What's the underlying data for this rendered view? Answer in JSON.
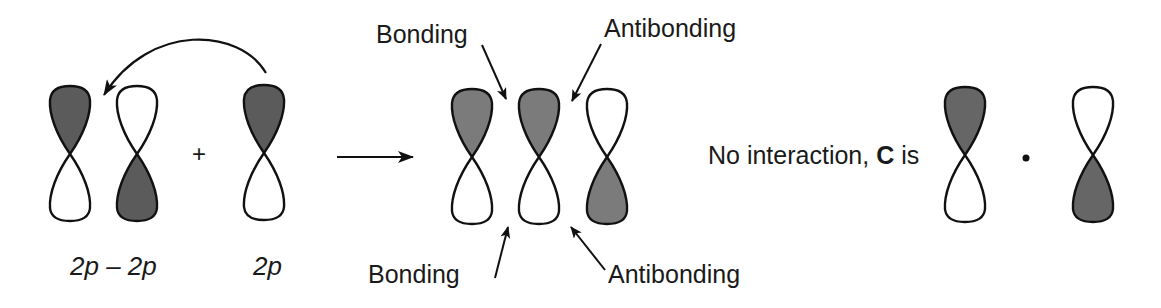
{
  "figure": {
    "group1": {
      "combination_label": "2p – 2p",
      "single_label": "2p",
      "plus_sign": "+",
      "combination_orbitals": [
        {
          "name": "orbital-2p-a",
          "cx": 70,
          "shaded_lobe": "top"
        },
        {
          "name": "orbital-2p-b",
          "cx": 137,
          "shaded_lobe": "bottom"
        }
      ],
      "single_orbital": {
        "name": "orbital-2p-single",
        "cx": 264,
        "shaded_lobe": "top"
      },
      "fill_color": "#5b5b5b"
    },
    "reaction_arrow": {
      "from_x": 337,
      "to_x": 413,
      "y": 157
    },
    "group2": {
      "orbitals": [
        {
          "name": "orbital-result-1",
          "cx": 472,
          "shaded_lobe": "top"
        },
        {
          "name": "orbital-result-2",
          "cx": 539,
          "shaded_lobe": "top"
        },
        {
          "name": "orbital-result-3",
          "cx": 607,
          "shaded_lobe": "bottom"
        }
      ],
      "annotations": {
        "top_left": "Bonding",
        "top_right": "Antibonding",
        "bottom_left": "Bonding",
        "bottom_right": "Antibonding"
      },
      "fill_color": "#7b7b7b"
    },
    "group3": {
      "text_prefix": "No interaction, ",
      "text_bold": "C",
      "text_suffix": " is",
      "orbitals": [
        {
          "name": "orbital-c-left",
          "cx": 965,
          "shaded_lobe": "top"
        },
        {
          "name": "orbital-c-right",
          "cx": 1093,
          "shaded_lobe": "bottom"
        }
      ],
      "separator": "dot",
      "fill_color": "#666666"
    },
    "stroke_color": "#111111",
    "background": "#ffffff"
  }
}
